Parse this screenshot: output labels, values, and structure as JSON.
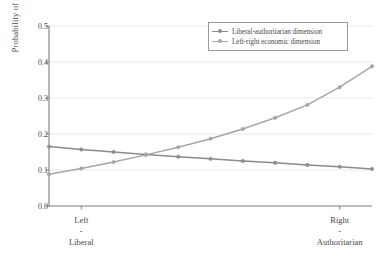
{
  "chart_data": {
    "type": "line",
    "title": "",
    "xlabel": "",
    "ylabel": "Probability of switching",
    "ylim": [
      0.0,
      0.5
    ],
    "yticks": [
      "0.0",
      "0.1",
      "0.2",
      "0.3",
      "0.4",
      "0.5"
    ],
    "ytick_values": [
      0.0,
      0.1,
      0.2,
      0.3,
      0.4,
      0.5
    ],
    "grid": "horizontal",
    "legend_position": "top-right",
    "x": [
      0,
      1,
      2,
      3,
      4,
      5,
      6,
      7,
      8,
      9,
      10
    ],
    "xticks": [
      {
        "value": 1,
        "lines": [
          "Left",
          "-",
          "Liberal"
        ]
      },
      {
        "value": 9,
        "lines": [
          "Right",
          "-",
          "Authoritarian"
        ]
      }
    ],
    "series": [
      {
        "name": "Liberal-authoritarian dimension",
        "color": "#8c8c8c",
        "marker": "circle",
        "values": [
          0.165,
          0.157,
          0.15,
          0.143,
          0.137,
          0.131,
          0.125,
          0.12,
          0.114,
          0.109,
          0.103
        ]
      },
      {
        "name": "Left-right economic dimension",
        "color": "#a6a6a6",
        "marker": "circle",
        "values": [
          0.088,
          0.104,
          0.122,
          0.142,
          0.163,
          0.187,
          0.214,
          0.245,
          0.281,
          0.33,
          0.388
        ]
      }
    ]
  },
  "colors": {
    "axis": "#7d7d7d",
    "grid": "#e2e2e2",
    "text": "#4a4a4a",
    "background": "#ffffff",
    "legend_border": "#9a9a9a"
  }
}
